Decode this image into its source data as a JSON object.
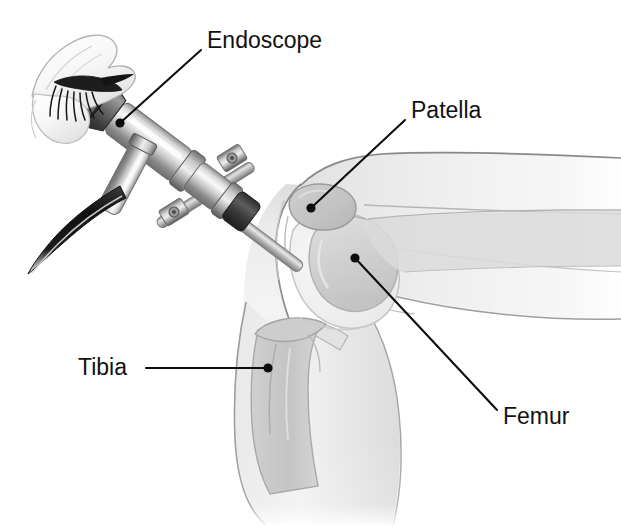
{
  "figure": {
    "background_color": "#ffffff",
    "style": "grayscale medical line illustration",
    "width": 621,
    "height": 529
  },
  "palette": {
    "label_text": "#111111",
    "leader_line": "#0d0d0d",
    "skin_light": "#f2f2f2",
    "skin_mid": "#e4e4e4",
    "skin_shadow": "#d2d2d2",
    "bone_light": "#e0e0e0",
    "bone_mid": "#cdcdcd",
    "bone_dark": "#b9b9b9",
    "cartilage": "#f6f6f6",
    "outline": "#8f8f8f",
    "outline_dark": "#6a6a6a",
    "metal_light": "#f0f0f0",
    "metal_mid": "#b4b4b4",
    "metal_dark": "#787878",
    "metal_darkest": "#3c3c3c",
    "cable_dark": "#1a1a1a",
    "eye_white": "#fbfbfb",
    "lash_dark": "#141414"
  },
  "labels": [
    {
      "id": "endoscope",
      "text": "Endoscope",
      "name": "label-endoscope",
      "text_x": 207,
      "text_y": 42,
      "anchor": "start",
      "leader_points": "201,50 120,123",
      "dot_x": 120,
      "dot_y": 123,
      "dot_r": 4.6,
      "points_to": "eyepiece body of the arthroscope"
    },
    {
      "id": "patella",
      "text": "Patella",
      "name": "label-patella",
      "text_x": 411,
      "text_y": 112,
      "anchor": "start",
      "leader_points": "405,120 311,208",
      "dot_x": 311,
      "dot_y": 208,
      "dot_r": 4.6,
      "points_to": "kneecap bone at front of joint"
    },
    {
      "id": "tibia",
      "text": "Tibia",
      "name": "label-tibia",
      "text_x": 78,
      "text_y": 369,
      "anchor": "start",
      "leader_points": "146,368 268,368",
      "dot_x": 268,
      "dot_y": 368,
      "dot_r": 4.6,
      "points_to": "shin bone below the joint"
    },
    {
      "id": "femur",
      "text": "Femur",
      "name": "label-femur",
      "text_x": 503,
      "text_y": 418,
      "anchor": "start",
      "leader_points": "355,258 497,410",
      "dot_x": 355,
      "dot_y": 258,
      "dot_r": 4.6,
      "points_to": "thigh bone condyle in the joint"
    }
  ],
  "anatomy": {
    "parts": [
      {
        "name": "thigh",
        "description": "upper leg extending to the right edge"
      },
      {
        "name": "calf",
        "description": "lower leg descending to bottom"
      },
      {
        "name": "patella",
        "description": "kneecap, oval bone at anterior knee"
      },
      {
        "name": "femoral-condyle",
        "description": "rounded distal end of femur"
      },
      {
        "name": "tibial-plateau",
        "description": "upper end of tibia"
      },
      {
        "name": "joint-space",
        "description": "cartilage gap between femur and tibia"
      },
      {
        "name": "patellar-tendon",
        "description": "band below the patella"
      }
    ]
  },
  "instrument": {
    "name": "arthroscope",
    "parts": [
      {
        "name": "eyepiece",
        "description": "flared dark ocular cup at proximal end"
      },
      {
        "name": "scope-body",
        "description": "tapered metallic barrel"
      },
      {
        "name": "light-post",
        "description": "side connector for fiber-optic cable"
      },
      {
        "name": "fiber-optic-cable",
        "description": "dark curved cable leading off to lower left"
      },
      {
        "name": "cross-clamp",
        "description": "X-shaped clamp with hex-bolt ends"
      },
      {
        "name": "cannula-shaft",
        "description": "thin straight shaft entering the joint"
      }
    ]
  },
  "observer": {
    "name": "surgeon-eye",
    "description": "closed eye with eyelashes and brow pressed to the eyepiece"
  }
}
